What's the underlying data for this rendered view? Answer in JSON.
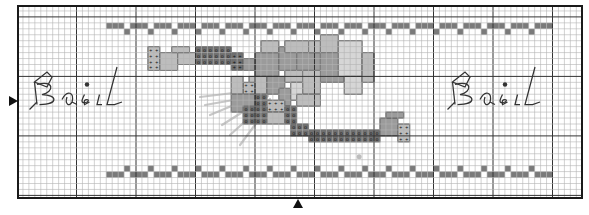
{
  "chart": {
    "type": "cross-stitch-pattern",
    "origin_px": [
      17,
      5
    ],
    "cell_px": 5.95,
    "cols": 95,
    "rows": 33,
    "major_every": 10,
    "major_col_offset": 0,
    "major_row_offset": 2,
    "center_marks": {
      "left_arrow_row": 16,
      "bottom_arrow_col": 47
    },
    "colors": {
      "grid_minor": "#b4b4b4",
      "grid_major": "#333333",
      "frame": "#1a1a1a",
      "dark": "#6f6f6f",
      "medium": "#9b9b9b",
      "light": "#bdbdbd",
      "extra_light": "#d6d6d6",
      "band": "#7a7a7a",
      "stem": "#c8c8c8",
      "backstitch": "#333333"
    }
  },
  "text_left": {
    "label": "Basil",
    "x": 22,
    "y": 82
  },
  "text_right": {
    "label": "Basil",
    "x": 440,
    "y": 82
  },
  "borders": {
    "top": {
      "bar_row": 3,
      "dot_row": 4,
      "start_col": 15,
      "end_col": 90,
      "period": 4
    },
    "bottom": {
      "dot_row": 27,
      "bar_row": 28,
      "start_col": 15,
      "end_col": 90,
      "period": 4
    }
  },
  "motif": {
    "ribbon_top": [
      {
        "c": 22,
        "r": 7,
        "w": 2,
        "h": 4,
        "tone": "light",
        "sym": "+"
      },
      {
        "c": 24,
        "r": 8,
        "w": 3,
        "h": 3,
        "tone": "light"
      },
      {
        "c": 27,
        "r": 8,
        "w": 3,
        "h": 2,
        "tone": "light"
      },
      {
        "c": 26,
        "r": 7,
        "w": 3,
        "h": 1,
        "tone": "light"
      },
      {
        "c": 30,
        "r": 7,
        "w": 6,
        "h": 3,
        "tone": "dark",
        "sym": "o"
      },
      {
        "c": 36,
        "r": 8,
        "w": 2,
        "h": 3,
        "tone": "dark",
        "sym": "+"
      },
      {
        "c": 38,
        "r": 9,
        "w": 2,
        "h": 2,
        "tone": "medium"
      }
    ],
    "leaves": [
      {
        "c": 40,
        "r": 8,
        "w": 4,
        "h": 4,
        "tone": "medium"
      },
      {
        "c": 41,
        "r": 6,
        "w": 3,
        "h": 2,
        "tone": "light"
      },
      {
        "c": 44,
        "r": 7,
        "w": 3,
        "h": 4,
        "tone": "medium"
      },
      {
        "c": 45,
        "r": 6,
        "w": 4,
        "h": 2,
        "tone": "light"
      },
      {
        "c": 47,
        "r": 8,
        "w": 4,
        "h": 3,
        "tone": "medium"
      },
      {
        "c": 49,
        "r": 6,
        "w": 2,
        "h": 2,
        "tone": "light"
      },
      {
        "c": 51,
        "r": 5,
        "w": 3,
        "h": 3,
        "tone": "light"
      },
      {
        "c": 51,
        "r": 8,
        "w": 4,
        "h": 5,
        "tone": "medium"
      },
      {
        "c": 54,
        "r": 6,
        "w": 4,
        "h": 6,
        "tone": "extra_light"
      },
      {
        "c": 55,
        "r": 12,
        "w": 3,
        "h": 3,
        "tone": "extra_light"
      },
      {
        "c": 58,
        "r": 8,
        "w": 2,
        "h": 5,
        "tone": "light"
      },
      {
        "c": 39,
        "r": 12,
        "w": 3,
        "h": 3,
        "tone": "light"
      },
      {
        "c": 42,
        "r": 12,
        "w": 3,
        "h": 3,
        "tone": "medium"
      },
      {
        "c": 45,
        "r": 11,
        "w": 4,
        "h": 2,
        "tone": "light"
      },
      {
        "c": 48,
        "r": 11,
        "w": 3,
        "h": 4,
        "tone": "light"
      },
      {
        "c": 44,
        "r": 14,
        "w": 2,
        "h": 3,
        "tone": "medium"
      },
      {
        "c": 46,
        "r": 13,
        "w": 2,
        "h": 3,
        "tone": "extra_light"
      },
      {
        "c": 47,
        "r": 15,
        "w": 4,
        "h": 2,
        "tone": "light"
      },
      {
        "c": 38,
        "r": 13,
        "w": 2,
        "h": 2,
        "tone": "light",
        "sym": "+"
      },
      {
        "c": 40,
        "r": 15,
        "w": 2,
        "h": 2,
        "tone": "dark",
        "sym": "o"
      },
      {
        "c": 36,
        "r": 12,
        "w": 2,
        "h": 3,
        "tone": "light"
      },
      {
        "c": 36,
        "r": 15,
        "w": 4,
        "h": 3,
        "tone": "medium"
      }
    ],
    "ribbon_bottom": [
      {
        "c": 42,
        "r": 16,
        "w": 3,
        "h": 2,
        "tone": "light",
        "sym": "+"
      },
      {
        "c": 38,
        "r": 17,
        "w": 4,
        "h": 3,
        "tone": "dark",
        "sym": "o"
      },
      {
        "c": 42,
        "r": 18,
        "w": 3,
        "h": 2,
        "tone": "light"
      },
      {
        "c": 45,
        "r": 17,
        "w": 2,
        "h": 3,
        "tone": "dark",
        "sym": "o"
      },
      {
        "c": 46,
        "r": 20,
        "w": 3,
        "h": 2,
        "tone": "dark",
        "sym": "o"
      },
      {
        "c": 49,
        "r": 21,
        "w": 12,
        "h": 2,
        "tone": "dark",
        "sym": "o"
      },
      {
        "c": 61,
        "r": 19,
        "w": 3,
        "h": 3,
        "tone": "medium"
      },
      {
        "c": 64,
        "r": 20,
        "w": 2,
        "h": 3,
        "tone": "light",
        "sym": "+"
      },
      {
        "c": 62,
        "r": 18,
        "w": 3,
        "h": 1,
        "tone": "medium"
      }
    ],
    "spot": {
      "c": 57,
      "r": 25,
      "w": 1,
      "h": 1,
      "tone": "light"
    }
  },
  "stems": [
    {
      "x1": 200,
      "y1": 97,
      "x2": 258,
      "y2": 90
    },
    {
      "x1": 210,
      "y1": 115,
      "x2": 265,
      "y2": 92
    },
    {
      "x1": 222,
      "y1": 125,
      "x2": 268,
      "y2": 96
    },
    {
      "x1": 230,
      "y1": 135,
      "x2": 270,
      "y2": 99
    },
    {
      "x1": 240,
      "y1": 145,
      "x2": 272,
      "y2": 102
    },
    {
      "x1": 205,
      "y1": 105,
      "x2": 262,
      "y2": 95
    }
  ],
  "backstitch_basil": [
    "M10 0 L20 -8 L24 -4 L20 4 Z",
    "M6 22 L12 16",
    "M10 0 L12 18",
    "M12 2 C26 -2 26 8 16 10 C28 10 30 18 14 18",
    "M32 14 C36 6 42 8 40 16 C38 20 34 18 36 12",
    "M40 16 L44 18",
    "M50 10 C48 14 46 18 52 16 C56 14 48 12 50 18 L54 16",
    "M62 10 L60 18 L64 18",
    "M76 -12 L68 18 L74 18 L80 16"
  ]
}
